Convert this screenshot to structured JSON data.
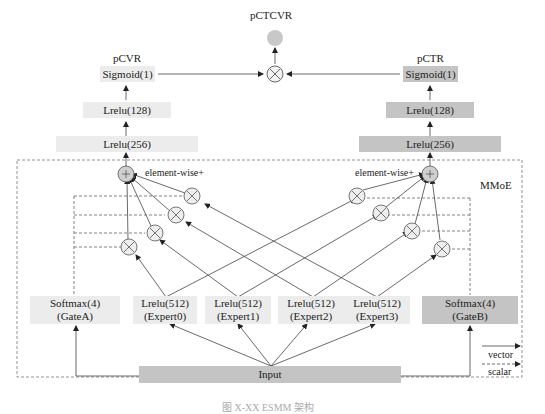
{
  "diagram": {
    "outputs": {
      "pctcvr": "pCTCVR",
      "pcvr": "pCVR",
      "pctr": "pCTR"
    },
    "left_tower": {
      "sigmoid": "Sigmoid(1)",
      "lrelu128": "Lrelu(128)",
      "lrelu256": "Lrelu(256)"
    },
    "right_tower": {
      "sigmoid": "Sigmoid(1)",
      "lrelu128": "Lrelu(128)",
      "lrelu256": "Lrelu(256)"
    },
    "mmoe_label": "MMoE",
    "element_wise_left": "element-wise+",
    "element_wise_right": "element-wise+",
    "plus_symbol": "+",
    "multiply_symbol": "×",
    "gates": [
      {
        "line1": "Softmax(4)",
        "line2": "(GateA)"
      },
      {
        "line1": "Softmax(4)",
        "line2": "(GateB)"
      }
    ],
    "experts": [
      {
        "line1": "Lrelu(512)",
        "line2": "(Expert0)"
      },
      {
        "line1": "Lrelu(512)",
        "line2": "(Expert1)"
      },
      {
        "line1": "Lrelu(512)",
        "line2": "(Expert2)"
      },
      {
        "line1": "Lrelu(512)",
        "line2": "(Expert3)"
      }
    ],
    "input": "Input",
    "legend": {
      "vector": "vector",
      "scalar": "scalar"
    },
    "caption": "图 X-XX  ESMM 架构",
    "colors": {
      "light_box": "#ececec",
      "dark_box": "#c4c4c4",
      "node_fill": "#e8e8e8",
      "output_node": "#c8c8c8",
      "line": "#333333",
      "dashed": "#666666"
    }
  }
}
